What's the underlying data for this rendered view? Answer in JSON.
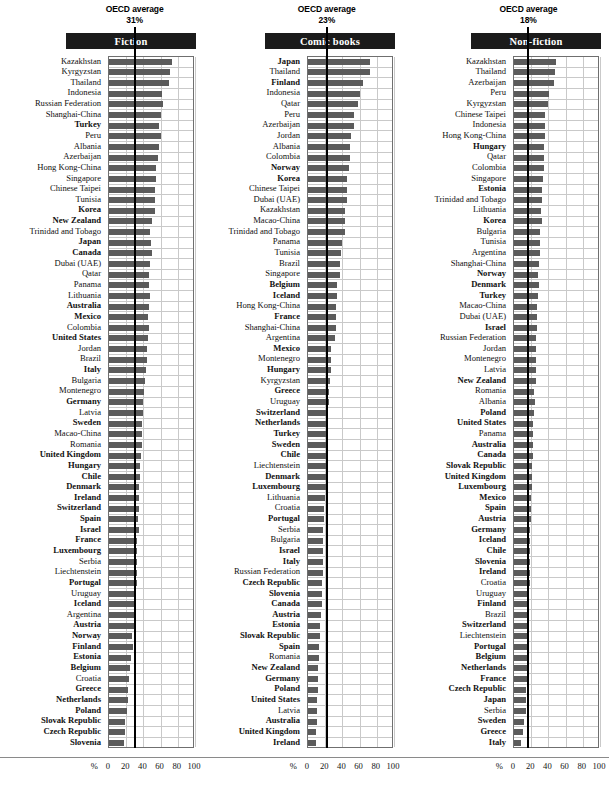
{
  "figure": {
    "axis_unit": "%",
    "x_ticks": [
      0,
      20,
      40,
      60,
      80,
      100
    ],
    "xlim": [
      0,
      100
    ],
    "grid": true,
    "bar_color": "#5b5b5b",
    "avg_line_color": "#000000",
    "title_bar_bg": "#1b1b1b"
  },
  "panels": [
    {
      "key": "fiction",
      "title": "Fiction",
      "oecd_label": "OECD average",
      "oecd_value_text": "31%",
      "oecd_value": 31
    },
    {
      "key": "comic",
      "title": "Comic books",
      "oecd_label": "OECD average",
      "oecd_value_text": "23%",
      "oecd_value": 23
    },
    {
      "key": "nonfiction",
      "title": "Non-fiction",
      "oecd_label": "OECD average",
      "oecd_value_text": "18%",
      "oecd_value": 18
    }
  ],
  "chart_data": [
    {
      "type": "bar",
      "title": "Fiction",
      "xlabel": "%",
      "ylabel": "",
      "xlim": [
        0,
        100
      ],
      "x_ticks": [
        0,
        20,
        40,
        60,
        80,
        100
      ],
      "grid": true,
      "legend": "none",
      "annotations": [
        {
          "text": "OECD average 31%",
          "value": 31
        }
      ],
      "categories": [
        "Kazakhstan",
        "Kyrgyzstan",
        "Thailand",
        "Indonesia",
        "Russian Federation",
        "Shanghai-China",
        "Turkey",
        "Peru",
        "Albania",
        "Azerbaijan",
        "Hong Kong-China",
        "Singapore",
        "Chinese Taipei",
        "Tunisia",
        "Korea",
        "New Zealand",
        "Trinidad and Tobago",
        "Japan",
        "Canada",
        "Dubai (UAE)",
        "Qatar",
        "Panama",
        "Lithuania",
        "Australia",
        "Mexico",
        "Colombia",
        "United States",
        "Jordan",
        "Brazil",
        "Italy",
        "Bulgaria",
        "Montenegro",
        "Germany",
        "Latvia",
        "Sweden",
        "Macao-China",
        "Romania",
        "United Kingdom",
        "Hungary",
        "Chile",
        "Denmark",
        "Ireland",
        "Switzerland",
        "Spain",
        "Israel",
        "France",
        "Luxembourg",
        "Serbia",
        "Liechtenstein",
        "Portugal",
        "Uruguay",
        "Iceland",
        "Argentina",
        "Austria",
        "Norway",
        "Finland",
        "Estonia",
        "Belgium",
        "Croatia",
        "Greece",
        "Netherlands",
        "Poland",
        "Slovak Republic",
        "Czech Republic",
        "Slovenia"
      ],
      "oecd_members": [
        "Turkey",
        "Korea",
        "New Zealand",
        "Japan",
        "Canada",
        "Australia",
        "Mexico",
        "United States",
        "Italy",
        "Germany",
        "Sweden",
        "United Kingdom",
        "Hungary",
        "Chile",
        "Denmark",
        "Ireland",
        "Switzerland",
        "Spain",
        "Israel",
        "France",
        "Luxembourg",
        "Portugal",
        "Iceland",
        "Austria",
        "Norway",
        "Finland",
        "Estonia",
        "Belgium",
        "Greece",
        "Netherlands",
        "Poland",
        "Slovak Republic",
        "Czech Republic",
        "Slovenia"
      ],
      "values": [
        73,
        71,
        70,
        62,
        63,
        60,
        58,
        60,
        58,
        57,
        55,
        55,
        54,
        54,
        54,
        50,
        48,
        49,
        50,
        48,
        47,
        47,
        48,
        47,
        45,
        46,
        45,
        44,
        44,
        43,
        42,
        41,
        40,
        39,
        38,
        38,
        38,
        37,
        36,
        36,
        35,
        35,
        35,
        34,
        35,
        33,
        32,
        32,
        32,
        32,
        30,
        30,
        29,
        29,
        27,
        28,
        26,
        24,
        23,
        22,
        22,
        21,
        19,
        19,
        17
      ]
    },
    {
      "type": "bar",
      "title": "Comic books",
      "xlabel": "%",
      "ylabel": "",
      "xlim": [
        0,
        100
      ],
      "x_ticks": [
        0,
        20,
        40,
        60,
        80,
        100
      ],
      "grid": true,
      "legend": "none",
      "annotations": [
        {
          "text": "OECD average 23%",
          "value": 23
        }
      ],
      "categories": [
        "Japan",
        "Thailand",
        "Finland",
        "Indonesia",
        "Qatar",
        "Peru",
        "Azerbaijan",
        "Jordan",
        "Albania",
        "Colombia",
        "Norway",
        "Korea",
        "Chinese Taipei",
        "Dubai (UAE)",
        "Kazakhstan",
        "Macao-China",
        "Trinidad and Tobago",
        "Panama",
        "Tunisia",
        "Brazil",
        "Singapore",
        "Belgium",
        "Iceland",
        "Hong Kong-China",
        "France",
        "Shanghai-China",
        "Argentina",
        "Mexico",
        "Montenegro",
        "Hungary",
        "Kyrgyzstan",
        "Greece",
        "Uruguay",
        "Switzerland",
        "Netherlands",
        "Turkey",
        "Sweden",
        "Chile",
        "Liechtenstein",
        "Denmark",
        "Luxembourg",
        "Lithuania",
        "Croatia",
        "Portugal",
        "Serbia",
        "Bulgaria",
        "Israel",
        "Italy",
        "Russian Federation",
        "Czech Republic",
        "Slovenia",
        "Canada",
        "Austria",
        "Estonia",
        "Slovak Republic",
        "Spain",
        "Romania",
        "New Zealand",
        "Germany",
        "Poland",
        "United States",
        "Latvia",
        "Australia",
        "United Kingdom",
        "Ireland"
      ],
      "oecd_members": [
        "Japan",
        "Finland",
        "Norway",
        "Korea",
        "Belgium",
        "Iceland",
        "France",
        "Mexico",
        "Hungary",
        "Greece",
        "Switzerland",
        "Netherlands",
        "Turkey",
        "Sweden",
        "Chile",
        "Denmark",
        "Luxembourg",
        "Portugal",
        "Israel",
        "Italy",
        "Czech Republic",
        "Slovenia",
        "Canada",
        "Austria",
        "Estonia",
        "Slovak Republic",
        "Spain",
        "New Zealand",
        "Germany",
        "Poland",
        "United States",
        "Australia",
        "United Kingdom",
        "Ireland"
      ],
      "values": [
        72,
        72,
        64,
        61,
        58,
        54,
        53,
        50,
        49,
        49,
        48,
        45,
        45,
        45,
        43,
        43,
        43,
        39,
        38,
        37,
        37,
        34,
        34,
        33,
        32,
        32,
        31,
        27,
        27,
        27,
        25,
        24,
        24,
        23,
        23,
        23,
        22,
        21,
        21,
        21,
        21,
        20,
        19,
        19,
        18,
        18,
        18,
        18,
        18,
        16,
        16,
        16,
        15,
        14,
        14,
        13,
        13,
        12,
        12,
        12,
        11,
        10,
        10,
        9,
        9
      ]
    },
    {
      "type": "bar",
      "title": "Non-fiction",
      "xlabel": "%",
      "ylabel": "",
      "xlim": [
        0,
        100
      ],
      "x_ticks": [
        0,
        20,
        40,
        60,
        80,
        100
      ],
      "grid": true,
      "legend": "none",
      "annotations": [
        {
          "text": "OECD average 18%",
          "value": 18
        }
      ],
      "categories": [
        "Kazakhstan",
        "Thailand",
        "Azerbaijan",
        "Peru",
        "Kyrgyzstan",
        "Chinese Taipei",
        "Indonesia",
        "Hong Kong-China",
        "Hungary",
        "Qatar",
        "Colombia",
        "Singapore",
        "Estonia",
        "Trinidad and Tobago",
        "Lithuania",
        "Korea",
        "Bulgaria",
        "Tunisia",
        "Argentina",
        "Shanghai-China",
        "Norway",
        "Denmark",
        "Turkey",
        "Macao-China",
        "Dubai (UAE)",
        "Israel",
        "Russian Federation",
        "Jordan",
        "Montenegro",
        "Latvia",
        "New Zealand",
        "Romania",
        "Albania",
        "Poland",
        "United States",
        "Panama",
        "Australia",
        "Canada",
        "Slovak Republic",
        "United Kingdom",
        "Luxembourg",
        "Mexico",
        "Spain",
        "Austria",
        "Germany",
        "Iceland",
        "Chile",
        "Slovenia",
        "Ireland",
        "Croatia",
        "Uruguay",
        "Finland",
        "Brazil",
        "Switzerland",
        "Liechtenstein",
        "Portugal",
        "Belgium",
        "Netherlands",
        "France",
        "Czech Republic",
        "Japan",
        "Serbia",
        "Sweden",
        "Greece",
        "Italy"
      ],
      "oecd_members": [
        "Hungary",
        "Estonia",
        "Korea",
        "Norway",
        "Denmark",
        "Turkey",
        "Israel",
        "New Zealand",
        "Poland",
        "United States",
        "Australia",
        "Canada",
        "Slovak Republic",
        "United Kingdom",
        "Luxembourg",
        "Mexico",
        "Spain",
        "Austria",
        "Germany",
        "Iceland",
        "Chile",
        "Slovenia",
        "Ireland",
        "Finland",
        "Switzerland",
        "Portugal",
        "Belgium",
        "Netherlands",
        "France",
        "Czech Republic",
        "Japan",
        "Sweden",
        "Greece",
        "Italy"
      ],
      "values": [
        49,
        48,
        46,
        41,
        40,
        36,
        36,
        36,
        35,
        35,
        35,
        34,
        33,
        33,
        31,
        32,
        30,
        30,
        30,
        29,
        28,
        29,
        28,
        27,
        27,
        27,
        25,
        26,
        26,
        25,
        26,
        23,
        24,
        23,
        22,
        22,
        22,
        22,
        21,
        21,
        21,
        20,
        20,
        20,
        19,
        19,
        19,
        19,
        19,
        19,
        18,
        18,
        17,
        17,
        16,
        17,
        16,
        16,
        15,
        14,
        14,
        14,
        12,
        10,
        8
      ]
    }
  ]
}
